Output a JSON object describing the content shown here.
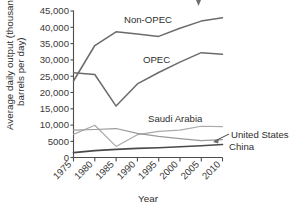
{
  "chart_data": {
    "type": "line",
    "title": "",
    "xlabel": "Year",
    "ylabel": "Average daily output (thousand barrels per day)",
    "ylabel_line1": "Average daily output (thousand",
    "ylabel_line2": "barrels per day)",
    "x": [
      1975,
      1980,
      1985,
      1990,
      1995,
      2000,
      2005,
      2010
    ],
    "categories": [
      "1975",
      "1980",
      "1985",
      "1990",
      "1995",
      "2000",
      "2005",
      "2010"
    ],
    "xlim": [
      1975,
      2010
    ],
    "ylim": [
      0,
      45000
    ],
    "yticks": [
      0,
      5000,
      10000,
      15000,
      20000,
      25000,
      30000,
      35000,
      40000,
      45000
    ],
    "ytick_labels": [
      "0",
      "5000",
      "10,000",
      "15,000",
      "20,000",
      "25,000",
      "30,000",
      "35,000",
      "40,000",
      "45,000"
    ],
    "grid": false,
    "legend": "inline-labels",
    "series": [
      {
        "name": "Non-OPEC",
        "color": "#6b6b6b",
        "label_text": "Non-OPEC",
        "values": [
          23500,
          34400,
          38600,
          37900,
          37200,
          39700,
          41900,
          42900
        ]
      },
      {
        "name": "OPEC",
        "color": "#6b6b6b",
        "label_text": "OPEC",
        "values": [
          26000,
          25500,
          15800,
          22600,
          26100,
          29300,
          32200,
          31700
        ]
      },
      {
        "name": "Saudi Arabia",
        "color": "#aaaaaa",
        "label_text": "Saudi Arabia",
        "values": [
          7100,
          9900,
          3400,
          7000,
          8000,
          8400,
          9600,
          9500
        ]
      },
      {
        "name": "United States",
        "color": "#9a9a9a",
        "label_text": "United States",
        "values": [
          8400,
          8600,
          8900,
          7400,
          6500,
          5800,
          5200,
          5500
        ]
      },
      {
        "name": "China",
        "color": "#4a4a4a",
        "label_text": "China",
        "values": [
          1500,
          2100,
          2500,
          2800,
          3000,
          3300,
          3600,
          4000
        ]
      }
    ],
    "annotations": [
      {
        "text": "Non-OPEC",
        "for": "Non-OPEC"
      },
      {
        "text": "OPEC",
        "for": "OPEC"
      },
      {
        "text": "Saudi Arabia",
        "for": "Saudi Arabia"
      },
      {
        "text": "United States",
        "for": "United States",
        "has_arrow": true
      },
      {
        "text": "China",
        "for": "China"
      }
    ]
  },
  "cursor": {
    "name": "mouse-pointer",
    "color": "#6e6e6e"
  }
}
